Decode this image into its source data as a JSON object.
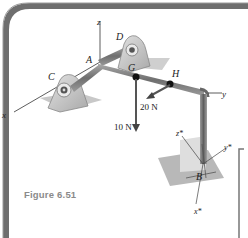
{
  "figure": {
    "caption": "Figure 6.51",
    "points": {
      "A": "A",
      "B": "B",
      "C": "C",
      "D": "D",
      "G": "G",
      "H": "H"
    },
    "axes": {
      "x": "x",
      "y": "y",
      "z": "z",
      "x_star": "x*",
      "y_star": "y*",
      "z_star": "z*"
    },
    "forces": [
      {
        "point": "G",
        "label": "10 N",
        "direction": "down"
      },
      {
        "point": "H",
        "label": "20 N",
        "direction": "-x (out of page, down-left)"
      }
    ],
    "colors": {
      "frame": "#6e6e6e",
      "shaft": "#8c8c8c",
      "bearing": "#c9c9c9",
      "shadow": "#bdbdbd",
      "caption": "#8a8a8a"
    }
  }
}
